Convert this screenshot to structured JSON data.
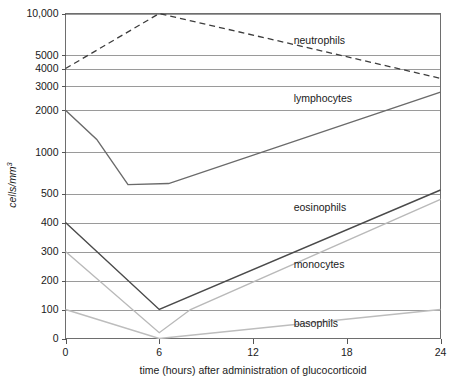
{
  "chart_data": {
    "type": "line",
    "title": "",
    "xlabel": "time (hours) after administration of glucocorticoid",
    "ylabel": "cells/mm",
    "ylabel_sup": "3",
    "yscale": "log",
    "xlim": [
      0,
      24
    ],
    "ylim": [
      0,
      10000
    ],
    "grid": true,
    "legend_position": "inline-right",
    "xticks": [
      "0",
      "6",
      "12",
      "18",
      "24"
    ],
    "xtick_values": [
      0,
      6,
      12,
      18,
      24
    ],
    "yticks": [
      "10,000",
      "5000",
      "4000",
      "3000",
      "2000",
      "1000",
      "500",
      "400",
      "300",
      "200",
      "100",
      "0"
    ],
    "ytick_values": [
      10000,
      5000,
      4000,
      3000,
      2000,
      1000,
      500,
      400,
      300,
      200,
      100,
      0
    ],
    "series": [
      {
        "name": "neutrophils",
        "style": "dashed",
        "color": "#3d3d3d",
        "label_x": 14.6,
        "label_y_value": 6400,
        "x": [
          0,
          6,
          24
        ],
        "values": [
          4000,
          10000,
          3400
        ]
      },
      {
        "name": "lymphocytes",
        "style": "solid",
        "color": "#6a6a6a",
        "label_x": 14.6,
        "label_y_value": 2450,
        "x": [
          0,
          2,
          4,
          6.6,
          24
        ],
        "values": [
          2000,
          1230,
          580,
          590,
          2700
        ]
      },
      {
        "name": "eosinophils",
        "style": "solid",
        "color": "#4a4a4a",
        "label_x": 14.6,
        "label_y_value": 452,
        "x": [
          0,
          6,
          24
        ],
        "values": [
          400,
          100,
          530
        ]
      },
      {
        "name": "monocytes",
        "style": "solid",
        "color": "#b9b9b9",
        "label_x": 14.6,
        "label_y_value": 256,
        "x": [
          0,
          6,
          8,
          24
        ],
        "values": [
          300,
          20,
          100,
          480
        ]
      },
      {
        "name": "basophils",
        "style": "solid",
        "color": "#bdbdbd",
        "label_x": 14.6,
        "label_y_value": 52,
        "x": [
          0,
          6,
          24
        ],
        "values": [
          100,
          0,
          100
        ]
      }
    ]
  }
}
